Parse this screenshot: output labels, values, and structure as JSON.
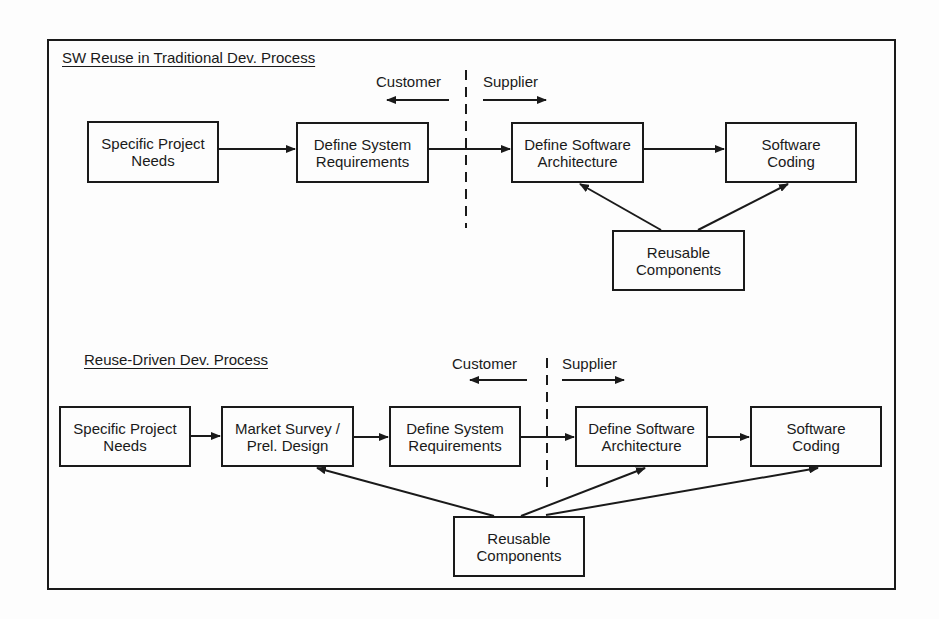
{
  "diagram": {
    "top": {
      "title": "SW Reuse in Traditional Dev. Process",
      "customer_label": "Customer",
      "supplier_label": "Supplier",
      "boxes": [
        {
          "line1": "Specific Project",
          "line2": "Needs"
        },
        {
          "line1": "Define System",
          "line2": "Requirements"
        },
        {
          "line1": "Define Software",
          "line2": "Architecture"
        },
        {
          "line1": "Software",
          "line2": "Coding"
        },
        {
          "line1": "Reusable",
          "line2": "Components"
        }
      ]
    },
    "bottom": {
      "title": "Reuse-Driven Dev. Process",
      "customer_label": "Customer",
      "supplier_label": "Supplier",
      "boxes": [
        {
          "line1": "Specific Project",
          "line2": "Needs"
        },
        {
          "line1": "Market Survey /",
          "line2": "Prel. Design"
        },
        {
          "line1": "Define System",
          "line2": "Requirements"
        },
        {
          "line1": "Define Software",
          "line2": "Architecture"
        },
        {
          "line1": "Software",
          "line2": "Coding"
        },
        {
          "line1": "Reusable",
          "line2": "Components"
        }
      ]
    },
    "edges": {
      "top": [
        [
          "Specific Project Needs",
          "Define System Requirements"
        ],
        [
          "Define System Requirements",
          "Define Software Architecture"
        ],
        [
          "Define Software Architecture",
          "Software Coding"
        ],
        [
          "Reusable Components",
          "Define Software Architecture"
        ],
        [
          "Reusable Components",
          "Software Coding"
        ]
      ],
      "bottom": [
        [
          "Specific Project Needs",
          "Market Survey / Prel. Design"
        ],
        [
          "Market Survey / Prel. Design",
          "Define System Requirements"
        ],
        [
          "Define System Requirements",
          "Define Software Architecture"
        ],
        [
          "Define Software Architecture",
          "Software Coding"
        ],
        [
          "Reusable Components",
          "Market Survey / Prel. Design"
        ],
        [
          "Reusable Components",
          "Define Software Architecture"
        ],
        [
          "Reusable Components",
          "Software Coding"
        ]
      ]
    }
  }
}
